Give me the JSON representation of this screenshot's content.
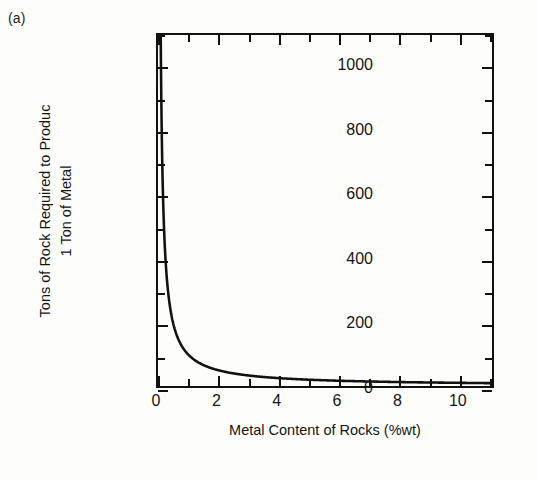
{
  "figure": {
    "panel_label": "(a)",
    "background_color": "#fdfdfb",
    "ink_color": "#111111"
  },
  "chart_data": {
    "type": "line",
    "title": "",
    "panel": "(a)",
    "xlabel": "Metal Content of Rocks (%wt)",
    "ylabel_line1": "Tons of Rock Required to Produc",
    "ylabel_line2": "1 Ton of Metal",
    "xlim": [
      0,
      11.2
    ],
    "ylim": [
      0,
      1100
    ],
    "grid": false,
    "legend": null,
    "x_major_ticks": [
      0,
      2,
      4,
      6,
      8,
      10
    ],
    "x_minor_ticks": [
      1,
      3,
      5,
      7,
      9,
      11
    ],
    "x_tick_labels": [
      "0",
      "2",
      "4",
      "6",
      "8",
      "10"
    ],
    "y_major_ticks": [
      0,
      200,
      400,
      600,
      800,
      1000
    ],
    "y_minor_ticks": [
      100,
      300,
      500,
      700,
      900,
      1100
    ],
    "y_tick_labels": [
      "0",
      "200",
      "400",
      "600",
      "800",
      "1000"
    ],
    "series": [
      {
        "name": "Tons of rock per ton of metal",
        "relation": "y = 100 / x",
        "x": [
          0.09,
          0.1,
          0.12,
          0.15,
          0.2,
          0.25,
          0.3,
          0.4,
          0.5,
          0.6,
          0.7,
          0.8,
          0.9,
          1.0,
          1.2,
          1.5,
          1.75,
          2.0,
          2.5,
          3.0,
          3.5,
          4.0,
          5.0,
          6.0,
          7.0,
          8.0,
          9.0,
          10.0,
          11.0,
          11.2
        ],
        "y": [
          1111,
          1000,
          833,
          667,
          500,
          400,
          333,
          250,
          200,
          167,
          143,
          125,
          111,
          100,
          83,
          67,
          57,
          50,
          40,
          33,
          29,
          25,
          20,
          17,
          14,
          13,
          11,
          10,
          9,
          9
        ]
      }
    ]
  }
}
